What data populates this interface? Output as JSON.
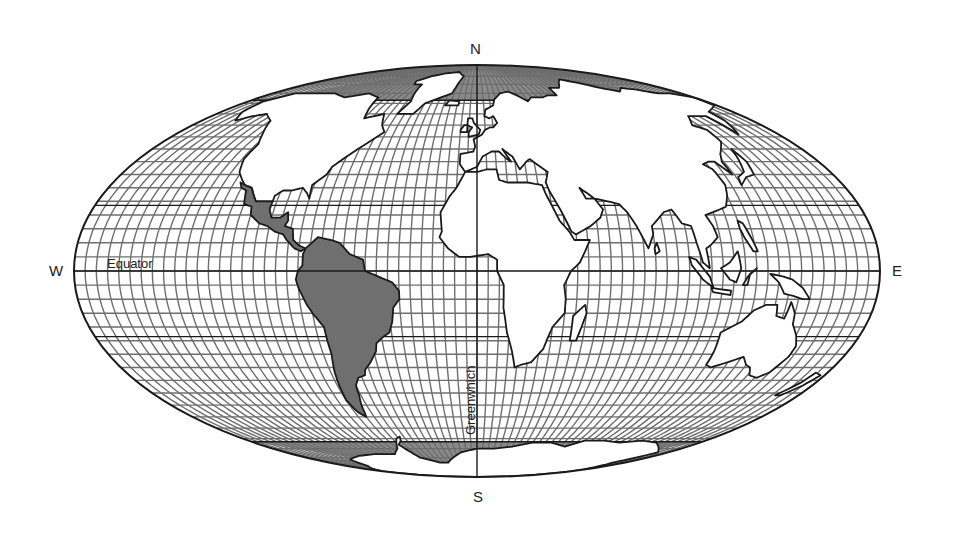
{
  "map": {
    "projection": "mollweide",
    "center": {
      "cx": 477,
      "cy": 271
    },
    "radii": {
      "rx": 403,
      "ry": 206
    },
    "graticule_step_deg": 5,
    "special_parallels_deg": [
      0,
      23.5,
      -23.5,
      66.5,
      -66.5
    ],
    "polar_fill_above_deg": 66.5,
    "colors": {
      "background": "#ffffff",
      "ocean": "#ffffff",
      "grid": "#6e6e6e",
      "outline": "#1a1a1a",
      "land": "#ffffff",
      "highlight_land": "#6f6f6f",
      "polar_fill": "#8a8a8a",
      "text": "#222222"
    },
    "highlighted_region": "Latin America"
  },
  "compass": {
    "north": "N",
    "south": "S",
    "east": "E",
    "west": "W"
  },
  "labels": {
    "equator": "Equator",
    "prime_meridian": "Greenwhich"
  }
}
